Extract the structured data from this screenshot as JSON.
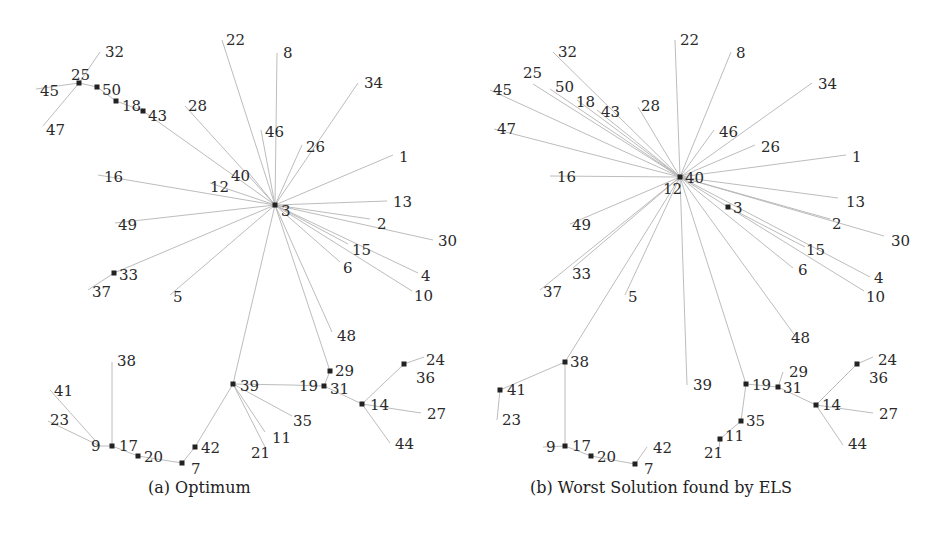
{
  "panels": [
    {
      "id": "a",
      "caption": "(a) Optimum",
      "nodes": {
        "3": {
          "x": 275,
          "y": 205,
          "lx": 281,
          "ly": 211,
          "m": true
        },
        "22": {
          "x": 222,
          "y": 40,
          "lx": 226,
          "ly": 40
        },
        "8": {
          "x": 277,
          "y": 53,
          "lx": 283,
          "ly": 53
        },
        "34": {
          "x": 358,
          "y": 83,
          "lx": 364,
          "ly": 83
        },
        "46": {
          "x": 261,
          "y": 130,
          "lx": 265,
          "ly": 132
        },
        "26": {
          "x": 302,
          "y": 145,
          "lx": 306,
          "ly": 147
        },
        "1": {
          "x": 393,
          "y": 155,
          "lx": 399,
          "ly": 157
        },
        "40": {
          "x": 248,
          "y": 172,
          "lx": 231,
          "ly": 176
        },
        "12": {
          "x": 210,
          "y": 183,
          "lx": 210,
          "ly": 187
        },
        "28": {
          "x": 185,
          "y": 106,
          "lx": 188,
          "ly": 106
        },
        "43": {
          "x": 143,
          "y": 111,
          "lx": 148,
          "ly": 116,
          "m": true
        },
        "18": {
          "x": 116,
          "y": 101,
          "lx": 122,
          "ly": 106,
          "m": true
        },
        "50": {
          "x": 97,
          "y": 87,
          "lx": 102,
          "ly": 90,
          "m": true
        },
        "25": {
          "x": 79,
          "y": 83,
          "lx": 71,
          "ly": 75,
          "m": true
        },
        "32": {
          "x": 100,
          "y": 52,
          "lx": 105,
          "ly": 52
        },
        "45": {
          "x": 36,
          "y": 89,
          "lx": 40,
          "ly": 91
        },
        "47": {
          "x": 43,
          "y": 126,
          "lx": 46,
          "ly": 130
        },
        "16": {
          "x": 98,
          "y": 175,
          "lx": 104,
          "ly": 177
        },
        "49": {
          "x": 115,
          "y": 223,
          "lx": 118,
          "ly": 225
        },
        "33": {
          "x": 114,
          "y": 273,
          "lx": 119,
          "ly": 275,
          "m": true
        },
        "37": {
          "x": 88,
          "y": 290,
          "lx": 92,
          "ly": 292
        },
        "5": {
          "x": 170,
          "y": 295,
          "lx": 173,
          "ly": 297
        },
        "13": {
          "x": 387,
          "y": 201,
          "lx": 393,
          "ly": 202
        },
        "2": {
          "x": 370,
          "y": 219,
          "lx": 377,
          "ly": 224
        },
        "30": {
          "x": 433,
          "y": 240,
          "lx": 438,
          "ly": 241
        },
        "15": {
          "x": 348,
          "y": 244,
          "lx": 352,
          "ly": 250
        },
        "6": {
          "x": 340,
          "y": 262,
          "lx": 343,
          "ly": 268
        },
        "4": {
          "x": 418,
          "y": 273,
          "lx": 421,
          "ly": 276
        },
        "10": {
          "x": 412,
          "y": 291,
          "lx": 414,
          "ly": 296
        },
        "48": {
          "x": 332,
          "y": 332,
          "lx": 337,
          "ly": 336
        },
        "39": {
          "x": 233,
          "y": 384,
          "lx": 240,
          "ly": 386,
          "m": true
        },
        "29": {
          "x": 330,
          "y": 371,
          "lx": 335,
          "ly": 371,
          "m": true
        },
        "31": {
          "x": 324,
          "y": 386,
          "lx": 330,
          "ly": 389,
          "m": true
        },
        "19": {
          "x": 291,
          "y": 385,
          "lx": 299,
          "ly": 386
        },
        "14": {
          "x": 362,
          "y": 404,
          "lx": 370,
          "ly": 405,
          "m": true
        },
        "36": {
          "x": 404,
          "y": 364,
          "lx": 416,
          "ly": 378,
          "m": true
        },
        "24": {
          "x": 424,
          "y": 357,
          "lx": 426,
          "ly": 360
        },
        "27": {
          "x": 421,
          "y": 413,
          "lx": 427,
          "ly": 414
        },
        "44": {
          "x": 390,
          "y": 443,
          "lx": 395,
          "ly": 444
        },
        "35": {
          "x": 292,
          "y": 416,
          "lx": 293,
          "ly": 421
        },
        "11": {
          "x": 265,
          "y": 432,
          "lx": 272,
          "ly": 438
        },
        "21": {
          "x": 265,
          "y": 447,
          "lx": 251,
          "ly": 453
        },
        "42": {
          "x": 195,
          "y": 447,
          "lx": 201,
          "ly": 448,
          "m": true
        },
        "7": {
          "x": 182,
          "y": 463,
          "lx": 191,
          "ly": 469,
          "m": true
        },
        "20": {
          "x": 138,
          "y": 456,
          "lx": 144,
          "ly": 457,
          "m": true
        },
        "17": {
          "x": 112,
          "y": 446,
          "lx": 119,
          "ly": 446,
          "m": true
        },
        "9": {
          "x": 100,
          "y": 446,
          "lx": 91,
          "ly": 446
        },
        "38": {
          "x": 112,
          "y": 362,
          "lx": 117,
          "ly": 361
        },
        "41": {
          "x": 50,
          "y": 390,
          "lx": 54,
          "ly": 391
        },
        "23": {
          "x": 48,
          "y": 421,
          "lx": 50,
          "ly": 420
        }
      },
      "edges": [
        [
          "3",
          "22"
        ],
        [
          "3",
          "8"
        ],
        [
          "3",
          "34"
        ],
        [
          "3",
          "46"
        ],
        [
          "3",
          "26"
        ],
        [
          "3",
          "1"
        ],
        [
          "3",
          "40"
        ],
        [
          "3",
          "12"
        ],
        [
          "3",
          "28"
        ],
        [
          "3",
          "43"
        ],
        [
          "43",
          "18"
        ],
        [
          "18",
          "50"
        ],
        [
          "50",
          "25"
        ],
        [
          "25",
          "32"
        ],
        [
          "25",
          "45"
        ],
        [
          "25",
          "47"
        ],
        [
          "3",
          "16"
        ],
        [
          "3",
          "49"
        ],
        [
          "3",
          "33"
        ],
        [
          "33",
          "37"
        ],
        [
          "3",
          "5"
        ],
        [
          "3",
          "13"
        ],
        [
          "3",
          "2"
        ],
        [
          "3",
          "30"
        ],
        [
          "3",
          "15"
        ],
        [
          "3",
          "6"
        ],
        [
          "3",
          "4"
        ],
        [
          "3",
          "10"
        ],
        [
          "3",
          "48"
        ],
        [
          "3",
          "39"
        ],
        [
          "3",
          "29"
        ],
        [
          "29",
          "31"
        ],
        [
          "31",
          "19"
        ],
        [
          "31",
          "14"
        ],
        [
          "14",
          "36"
        ],
        [
          "36",
          "24"
        ],
        [
          "14",
          "27"
        ],
        [
          "14",
          "44"
        ],
        [
          "39",
          "19"
        ],
        [
          "39",
          "35"
        ],
        [
          "39",
          "11"
        ],
        [
          "39",
          "21"
        ],
        [
          "39",
          "42"
        ],
        [
          "42",
          "7"
        ],
        [
          "7",
          "20"
        ],
        [
          "20",
          "17"
        ],
        [
          "17",
          "9"
        ],
        [
          "17",
          "38"
        ],
        [
          "9",
          "41"
        ],
        [
          "9",
          "23"
        ]
      ]
    },
    {
      "id": "b",
      "caption": "(b) Worst Solution found by ELS",
      "nodes": {
        "40": {
          "x": 680,
          "y": 177,
          "lx": 685,
          "ly": 178,
          "m": true
        },
        "12": {
          "x": 680,
          "y": 181,
          "lx": 663,
          "ly": 189
        },
        "22": {
          "x": 675,
          "y": 40,
          "lx": 680,
          "ly": 40
        },
        "8": {
          "x": 731,
          "y": 52,
          "lx": 736,
          "ly": 53
        },
        "32": {
          "x": 553,
          "y": 52,
          "lx": 558,
          "ly": 52
        },
        "25": {
          "x": 533,
          "y": 84,
          "lx": 523,
          "ly": 73
        },
        "45": {
          "x": 490,
          "y": 90,
          "lx": 493,
          "ly": 90
        },
        "50": {
          "x": 550,
          "y": 89,
          "lx": 555,
          "ly": 87
        },
        "18": {
          "x": 577,
          "y": 100,
          "lx": 576,
          "ly": 102
        },
        "43": {
          "x": 597,
          "y": 110,
          "lx": 601,
          "ly": 112
        },
        "28": {
          "x": 638,
          "y": 107,
          "lx": 641,
          "ly": 106
        },
        "47": {
          "x": 494,
          "y": 129,
          "lx": 497,
          "ly": 129
        },
        "16": {
          "x": 550,
          "y": 176,
          "lx": 557,
          "ly": 177
        },
        "34": {
          "x": 812,
          "y": 83,
          "lx": 818,
          "ly": 84
        },
        "46": {
          "x": 714,
          "y": 130,
          "lx": 719,
          "ly": 132
        },
        "26": {
          "x": 755,
          "y": 145,
          "lx": 761,
          "ly": 147
        },
        "1": {
          "x": 846,
          "y": 155,
          "lx": 852,
          "ly": 157
        },
        "13": {
          "x": 838,
          "y": 198,
          "lx": 846,
          "ly": 202
        },
        "2": {
          "x": 830,
          "y": 219,
          "lx": 832,
          "ly": 224
        },
        "30": {
          "x": 884,
          "y": 236,
          "lx": 891,
          "ly": 241
        },
        "3": {
          "x": 728,
          "y": 207,
          "lx": 733,
          "ly": 208,
          "m": true
        },
        "15": {
          "x": 805,
          "y": 247,
          "lx": 806,
          "ly": 250
        },
        "6": {
          "x": 793,
          "y": 268,
          "lx": 798,
          "ly": 270
        },
        "4": {
          "x": 870,
          "y": 277,
          "lx": 874,
          "ly": 278
        },
        "10": {
          "x": 864,
          "y": 291,
          "lx": 866,
          "ly": 297
        },
        "48": {
          "x": 796,
          "y": 337,
          "lx": 791,
          "ly": 338
        },
        "49": {
          "x": 570,
          "y": 224,
          "lx": 572,
          "ly": 225
        },
        "33": {
          "x": 573,
          "y": 268,
          "lx": 572,
          "ly": 274
        },
        "37": {
          "x": 540,
          "y": 290,
          "lx": 543,
          "ly": 292
        },
        "5": {
          "x": 625,
          "y": 295,
          "lx": 628,
          "ly": 297
        },
        "38": {
          "x": 565,
          "y": 362,
          "lx": 570,
          "ly": 362,
          "m": true
        },
        "41": {
          "x": 500,
          "y": 390,
          "lx": 507,
          "ly": 390,
          "m": true
        },
        "23": {
          "x": 497,
          "y": 420,
          "lx": 502,
          "ly": 420
        },
        "17": {
          "x": 565,
          "y": 446,
          "lx": 572,
          "ly": 446,
          "m": true
        },
        "9": {
          "x": 543,
          "y": 447,
          "lx": 546,
          "ly": 447
        },
        "20": {
          "x": 591,
          "y": 456,
          "lx": 597,
          "ly": 457,
          "m": true
        },
        "7": {
          "x": 635,
          "y": 464,
          "lx": 644,
          "ly": 469,
          "m": true
        },
        "42": {
          "x": 647,
          "y": 447,
          "lx": 653,
          "ly": 448
        },
        "39": {
          "x": 687,
          "y": 385,
          "lx": 693,
          "ly": 385
        },
        "19": {
          "x": 746,
          "y": 384,
          "lx": 752,
          "ly": 385,
          "m": true
        },
        "29": {
          "x": 783,
          "y": 372,
          "lx": 789,
          "ly": 372
        },
        "31": {
          "x": 778,
          "y": 387,
          "lx": 783,
          "ly": 388,
          "m": true
        },
        "14": {
          "x": 816,
          "y": 405,
          "lx": 822,
          "ly": 405,
          "m": true
        },
        "36": {
          "x": 857,
          "y": 364,
          "lx": 869,
          "ly": 378,
          "m": true
        },
        "24": {
          "x": 873,
          "y": 357,
          "lx": 878,
          "ly": 360
        },
        "27": {
          "x": 873,
          "y": 413,
          "lx": 879,
          "ly": 414
        },
        "44": {
          "x": 843,
          "y": 445,
          "lx": 848,
          "ly": 444
        },
        "35": {
          "x": 741,
          "y": 421,
          "lx": 746,
          "ly": 421,
          "m": true
        },
        "11": {
          "x": 720,
          "y": 439,
          "lx": 725,
          "ly": 436,
          "m": true
        },
        "21": {
          "x": 719,
          "y": 449,
          "lx": 704,
          "ly": 453
        }
      },
      "edges": [
        [
          "40",
          "22"
        ],
        [
          "40",
          "8"
        ],
        [
          "40",
          "32"
        ],
        [
          "40",
          "25"
        ],
        [
          "40",
          "45"
        ],
        [
          "40",
          "50"
        ],
        [
          "40",
          "18"
        ],
        [
          "40",
          "43"
        ],
        [
          "40",
          "28"
        ],
        [
          "40",
          "47"
        ],
        [
          "40",
          "16"
        ],
        [
          "40",
          "34"
        ],
        [
          "40",
          "46"
        ],
        [
          "40",
          "26"
        ],
        [
          "40",
          "1"
        ],
        [
          "40",
          "13"
        ],
        [
          "40",
          "2"
        ],
        [
          "40",
          "30"
        ],
        [
          "40",
          "3"
        ],
        [
          "3",
          "15"
        ],
        [
          "3",
          "10"
        ],
        [
          "40",
          "4"
        ],
        [
          "40",
          "6"
        ],
        [
          "40",
          "48"
        ],
        [
          "40",
          "49"
        ],
        [
          "40",
          "33"
        ],
        [
          "40",
          "37"
        ],
        [
          "40",
          "5"
        ],
        [
          "40",
          "38"
        ],
        [
          "38",
          "41"
        ],
        [
          "41",
          "23"
        ],
        [
          "38",
          "17"
        ],
        [
          "17",
          "9"
        ],
        [
          "17",
          "20"
        ],
        [
          "20",
          "7"
        ],
        [
          "7",
          "42"
        ],
        [
          "40",
          "39"
        ],
        [
          "40",
          "19"
        ],
        [
          "19",
          "35"
        ],
        [
          "35",
          "11"
        ],
        [
          "11",
          "21"
        ],
        [
          "19",
          "31"
        ],
        [
          "31",
          "29"
        ],
        [
          "31",
          "14"
        ],
        [
          "14",
          "36"
        ],
        [
          "36",
          "24"
        ],
        [
          "14",
          "27"
        ],
        [
          "14",
          "44"
        ]
      ]
    }
  ]
}
